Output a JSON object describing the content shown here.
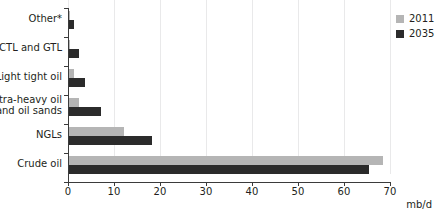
{
  "chart_data": {
    "type": "bar",
    "orientation": "horizontal",
    "title": "",
    "xlabel": "mb/d",
    "ylabel": "",
    "xlim": [
      0,
      70
    ],
    "xticks": [
      0,
      10,
      20,
      30,
      40,
      50,
      60,
      70
    ],
    "xtick_labels": [
      "0",
      "10",
      "20",
      "30",
      "40",
      "50",
      "60",
      "70"
    ],
    "grid": true,
    "grid_axis": "x",
    "legend_position": "top-right",
    "categories": [
      "Other*",
      "CTL and GTL",
      "Light tight oil",
      "Extra-heavy oil\nand oil sands",
      "NGLs",
      "Crude oil"
    ],
    "series": [
      {
        "name": "2011",
        "color": "#b5b5b5",
        "values": [
          0.3,
          0.2,
          1.0,
          2.2,
          12.0,
          68.5
        ]
      },
      {
        "name": "2035",
        "color": "#2b2b2b",
        "values": [
          1.0,
          2.1,
          3.5,
          7.0,
          18.0,
          65.5
        ]
      }
    ]
  },
  "axis": {
    "x_title": "mb/d"
  },
  "legend": {
    "items": [
      {
        "label": "2011",
        "color": "#b5b5b5"
      },
      {
        "label": "2035",
        "color": "#2b2b2b"
      }
    ]
  },
  "colors": {
    "series_2011": "#b5b5b5",
    "series_2035": "#2b2b2b",
    "axis": "#3b3b3b",
    "grid": "#e9e9ea",
    "text": "#231f20"
  }
}
